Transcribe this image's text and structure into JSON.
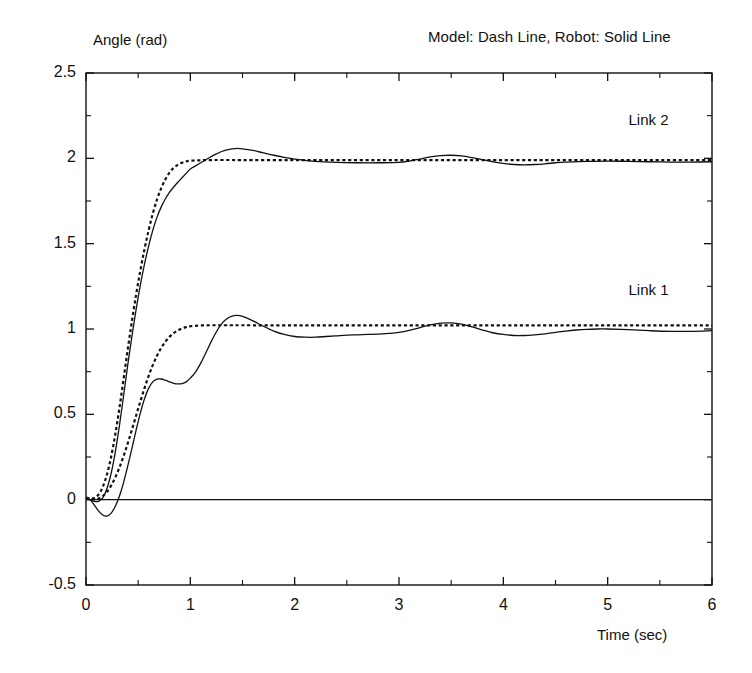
{
  "chart_data": {
    "type": "line",
    "title": "Model: Dash Line, Robot: Solid Line",
    "xlabel": "Time (sec)",
    "ylabel": "Angle (rad)",
    "xlim": [
      0,
      6
    ],
    "ylim": [
      -0.5,
      2.5
    ],
    "xticks": [
      "0",
      "1",
      "2",
      "3",
      "4",
      "5",
      "6"
    ],
    "xtick_values": [
      0,
      1,
      2,
      3,
      4,
      5,
      6
    ],
    "yticks": [
      "2.5",
      "2",
      "1.5",
      "1",
      "0.5",
      "0",
      "-0.5"
    ],
    "ytick_values": [
      2.5,
      2,
      1.5,
      1,
      0.5,
      0,
      -0.5
    ],
    "grid": false,
    "legend_position": "inline-annotations",
    "annotations": [
      {
        "text": "Link 2",
        "x": 5.2,
        "y": 2.22
      },
      {
        "text": "Link 1",
        "x": 5.2,
        "y": 1.22
      }
    ],
    "series": [
      {
        "name": "Link 1 Model",
        "style": "dashed",
        "color": "#111111",
        "steady_state": 1.02,
        "x": [
          0.0,
          0.04,
          0.08,
          0.12,
          0.16,
          0.2,
          0.24,
          0.28,
          0.32,
          0.36,
          0.4,
          0.44,
          0.48,
          0.52,
          0.56,
          0.6,
          0.64,
          0.68,
          0.72,
          0.76,
          0.8,
          0.84,
          0.88,
          0.92,
          0.96,
          1.0,
          1.1,
          1.25,
          1.5,
          2.0,
          2.5,
          3.0,
          3.5,
          4.0,
          4.5,
          5.0,
          5.5,
          6.0
        ],
        "y": [
          0.01,
          0.004,
          0.002,
          0.006,
          0.02,
          0.045,
          0.082,
          0.13,
          0.188,
          0.255,
          0.33,
          0.41,
          0.492,
          0.574,
          0.652,
          0.724,
          0.788,
          0.843,
          0.888,
          0.925,
          0.954,
          0.976,
          0.992,
          1.003,
          1.011,
          1.016,
          1.021,
          1.022,
          1.022,
          1.021,
          1.021,
          1.021,
          1.021,
          1.021,
          1.021,
          1.021,
          1.021,
          1.021
        ]
      },
      {
        "name": "Link 1 Robot",
        "style": "solid",
        "color": "#111111",
        "steady_state": 1.0,
        "x": [
          0.0,
          0.04,
          0.08,
          0.12,
          0.16,
          0.2,
          0.24,
          0.28,
          0.32,
          0.36,
          0.4,
          0.44,
          0.48,
          0.52,
          0.56,
          0.6,
          0.64,
          0.68,
          0.72,
          0.76,
          0.8,
          0.84,
          0.88,
          0.92,
          0.96,
          1.0,
          1.05,
          1.1,
          1.15,
          1.2,
          1.25,
          1.3,
          1.35,
          1.4,
          1.45,
          1.5,
          1.6,
          1.7,
          1.8,
          1.9,
          2.0,
          2.1,
          2.2,
          2.3,
          2.4,
          2.5,
          2.6,
          2.7,
          2.8,
          2.9,
          3.0,
          3.1,
          3.2,
          3.3,
          3.4,
          3.5,
          3.6,
          3.7,
          3.8,
          3.9,
          4.0,
          4.1,
          4.2,
          4.3,
          4.4,
          4.5,
          4.6,
          4.7,
          4.8,
          4.9,
          5.0,
          5.2,
          5.4,
          5.6,
          5.8,
          6.0
        ],
        "y": [
          0.012,
          0.0,
          -0.032,
          -0.066,
          -0.09,
          -0.096,
          -0.08,
          -0.04,
          0.02,
          0.1,
          0.196,
          0.3,
          0.406,
          0.506,
          0.59,
          0.652,
          0.69,
          0.706,
          0.707,
          0.7,
          0.69,
          0.682,
          0.678,
          0.68,
          0.69,
          0.712,
          0.748,
          0.8,
          0.862,
          0.926,
          0.984,
          1.03,
          1.06,
          1.076,
          1.08,
          1.074,
          1.048,
          1.016,
          0.988,
          0.968,
          0.956,
          0.952,
          0.952,
          0.956,
          0.96,
          0.964,
          0.966,
          0.968,
          0.97,
          0.974,
          0.98,
          0.992,
          1.008,
          1.024,
          1.034,
          1.036,
          1.028,
          1.012,
          0.994,
          0.978,
          0.968,
          0.962,
          0.962,
          0.966,
          0.972,
          0.98,
          0.988,
          0.994,
          0.998,
          1.0,
          1.0,
          0.996,
          0.99,
          0.986,
          0.986,
          0.99
        ]
      },
      {
        "name": "Link 2 Model",
        "style": "dashed",
        "color": "#111111",
        "steady_state": 1.99,
        "x": [
          0.0,
          0.04,
          0.08,
          0.12,
          0.16,
          0.2,
          0.24,
          0.28,
          0.32,
          0.36,
          0.4,
          0.44,
          0.48,
          0.52,
          0.56,
          0.6,
          0.64,
          0.68,
          0.72,
          0.76,
          0.8,
          0.84,
          0.88,
          0.92,
          0.96,
          1.0,
          1.2,
          1.5,
          2.0,
          2.5,
          3.0,
          3.5,
          4.0,
          4.5,
          5.0,
          5.5,
          6.0
        ],
        "y": [
          0.012,
          0.008,
          0.01,
          0.03,
          0.074,
          0.146,
          0.248,
          0.38,
          0.536,
          0.706,
          0.88,
          1.046,
          1.2,
          1.34,
          1.466,
          1.578,
          1.676,
          1.758,
          1.824,
          1.876,
          1.916,
          1.944,
          1.962,
          1.974,
          1.982,
          1.986,
          1.99,
          1.99,
          1.99,
          1.99,
          1.99,
          1.99,
          1.99,
          1.99,
          1.99,
          1.99,
          1.99
        ]
      },
      {
        "name": "Link 2 Robot",
        "style": "solid",
        "color": "#111111",
        "steady_state": 1.98,
        "x": [
          0.0,
          0.04,
          0.08,
          0.12,
          0.16,
          0.2,
          0.24,
          0.28,
          0.32,
          0.36,
          0.4,
          0.44,
          0.48,
          0.52,
          0.56,
          0.6,
          0.64,
          0.68,
          0.72,
          0.76,
          0.8,
          0.84,
          0.88,
          0.92,
          0.96,
          1.0,
          1.05,
          1.1,
          1.15,
          1.2,
          1.25,
          1.3,
          1.35,
          1.4,
          1.45,
          1.5,
          1.6,
          1.7,
          1.8,
          1.9,
          2.0,
          2.2,
          2.4,
          2.6,
          2.8,
          3.0,
          3.1,
          3.2,
          3.3,
          3.4,
          3.5,
          3.6,
          3.7,
          3.8,
          3.9,
          4.0,
          4.1,
          4.2,
          4.3,
          4.4,
          4.5,
          4.6,
          4.8,
          5.0,
          5.2,
          5.4,
          5.6,
          5.8,
          6.0
        ],
        "y": [
          0.01,
          0.0,
          -0.01,
          -0.01,
          0.01,
          0.064,
          0.152,
          0.276,
          0.432,
          0.608,
          0.788,
          0.958,
          1.114,
          1.254,
          1.378,
          1.486,
          1.578,
          1.654,
          1.714,
          1.762,
          1.8,
          1.832,
          1.86,
          1.886,
          1.912,
          1.938,
          1.956,
          1.974,
          1.992,
          2.01,
          2.026,
          2.04,
          2.05,
          2.056,
          2.058,
          2.056,
          2.046,
          2.032,
          2.018,
          2.006,
          1.996,
          1.982,
          1.976,
          1.974,
          1.974,
          1.976,
          1.984,
          1.996,
          2.008,
          2.016,
          2.018,
          2.014,
          2.004,
          1.992,
          1.98,
          1.97,
          1.964,
          1.962,
          1.964,
          1.968,
          1.974,
          1.978,
          1.982,
          1.984,
          1.982,
          1.98,
          1.978,
          1.978,
          1.98
        ]
      }
    ]
  },
  "axes": {
    "frame_color": "#111111"
  }
}
